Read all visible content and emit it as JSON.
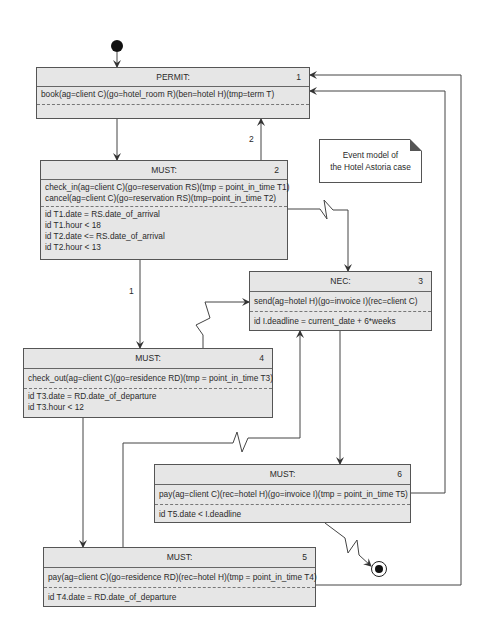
{
  "note": {
    "line1": "Event model of",
    "line2": "the Hotel Astoria case"
  },
  "states": [
    {
      "id": "permit-1",
      "type": "PERMIT:",
      "number": "1",
      "actions": [
        "book(ag=client C)(go=hotel_room R)(ben=hotel H)(tmp=term T)"
      ],
      "constraints": []
    },
    {
      "id": "must-2",
      "type": "MUST:",
      "number": "2",
      "actions": [
        "check_in(ag=client C)(go=reservation RS)(tmp = point_in_time T1)",
        "cancel(ag=client C)(go=reservation RS)(tmp=point_in_time T2)"
      ],
      "constraints": [
        "id T1.date = RS.date_of_arrival",
        "id T1.hour < 18",
        "id T2.date <= RS.date_of_arrival",
        "id T2.hour < 13"
      ]
    },
    {
      "id": "nec-3",
      "type": "NEC:",
      "number": "3",
      "actions": [
        "send(ag=hotel H)(go=invoice I)(rec=client C)"
      ],
      "constraints": [
        "id I.deadline = current_date + 6*weeks"
      ]
    },
    {
      "id": "must-4",
      "type": "MUST:",
      "number": "4",
      "actions": [
        "check_out(ag=client C)(go=residence RD)(tmp = point_in_time T3)"
      ],
      "constraints": [
        "id T3.date = RD.date_of_departure",
        "id T3.hour < 12"
      ]
    },
    {
      "id": "must-5",
      "type": "MUST:",
      "number": "5",
      "actions": [
        "pay(ag=client C)(go=residence RD)(rec=hotel H)(tmp = point_in_time T4)"
      ],
      "constraints": [
        "id T4.date = RD.date_of_departure"
      ]
    },
    {
      "id": "must-6",
      "type": "MUST:",
      "number": "6",
      "actions": [
        "pay(ag=client C)(rec=hotel H)(go=invoice I)(tmp = point_in_time T5)"
      ],
      "constraints": [
        "id T5.date < I.deadline"
      ]
    }
  ],
  "edge_labels": {
    "must2_to_permit": "2",
    "must2_to_must4": "1"
  },
  "colors": {
    "box_fill": "#e6e6e6",
    "line": "#444444"
  }
}
